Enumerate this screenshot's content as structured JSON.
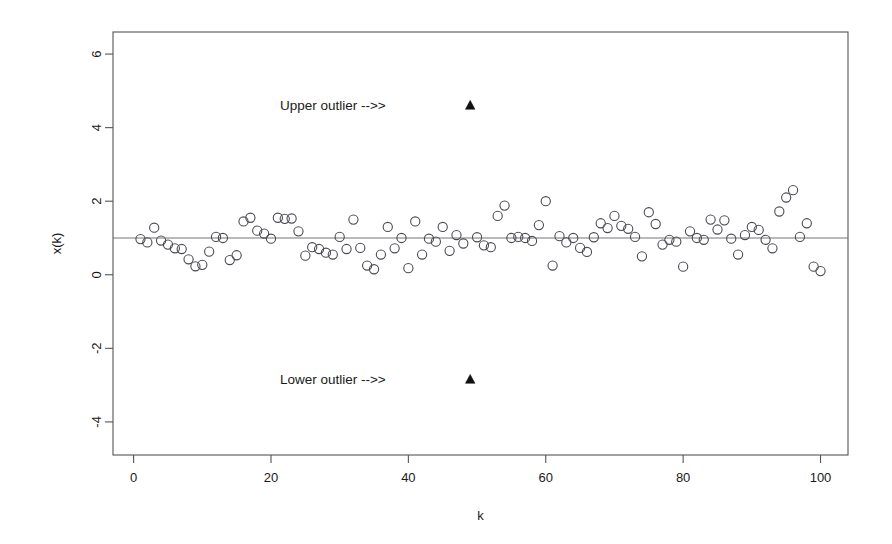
{
  "chart_data": {
    "type": "scatter",
    "title": "",
    "xlabel": "k",
    "ylabel": "x(k)",
    "xlim": [
      -3,
      104
    ],
    "ylim": [
      -4.9,
      6.6
    ],
    "grid": false,
    "legend": null,
    "xticks": [
      0,
      20,
      40,
      60,
      80,
      100
    ],
    "xtick_labels": [
      "0",
      "20",
      "40",
      "60",
      "80",
      "100"
    ],
    "yticks": [
      -4,
      -2,
      0,
      2,
      4,
      6
    ],
    "ytick_labels": [
      "-4",
      "-2",
      "0",
      "2",
      "4",
      "6"
    ],
    "reference_line": {
      "orientation": "horizontal",
      "y": 1,
      "label": ""
    },
    "marker_main": "open-circle",
    "marker_outlier": "filled-triangle",
    "annotations": [
      {
        "text": "Upper outlier -->>",
        "x": 29,
        "y": 4.6,
        "points_to_k": 49
      },
      {
        "text": "Lower outlier -->>",
        "x": 29,
        "y": -2.85,
        "points_to_k": 49
      }
    ],
    "series": [
      {
        "name": "x(k)",
        "marker": "open-circle",
        "x": [
          1,
          2,
          3,
          4,
          5,
          6,
          7,
          8,
          9,
          10,
          11,
          12,
          13,
          14,
          15,
          16,
          17,
          18,
          19,
          20,
          21,
          22,
          23,
          24,
          25,
          26,
          27,
          28,
          29,
          30,
          31,
          32,
          33,
          34,
          35,
          36,
          37,
          38,
          39,
          40,
          41,
          42,
          43,
          44,
          45,
          46,
          47,
          48,
          50,
          51,
          52,
          53,
          54,
          55,
          56,
          57,
          58,
          59,
          60,
          61,
          62,
          63,
          64,
          65,
          66,
          67,
          68,
          69,
          70,
          71,
          72,
          73,
          74,
          75,
          76,
          77,
          78,
          79,
          80,
          81,
          82,
          83,
          84,
          85,
          86,
          87,
          88,
          89,
          90,
          91,
          92,
          93,
          94,
          95,
          96,
          97,
          98,
          99,
          100
        ],
        "y": [
          0.97,
          0.88,
          1.28,
          0.93,
          0.82,
          0.72,
          0.7,
          0.42,
          0.23,
          0.27,
          0.63,
          1.03,
          1.0,
          0.4,
          0.53,
          1.45,
          1.55,
          1.2,
          1.12,
          0.98,
          1.55,
          1.52,
          1.53,
          1.18,
          0.52,
          0.75,
          0.7,
          0.6,
          0.55,
          1.03,
          0.7,
          1.5,
          0.73,
          0.25,
          0.15,
          0.55,
          1.3,
          0.72,
          1.0,
          0.18,
          1.45,
          0.55,
          0.98,
          0.9,
          1.3,
          0.65,
          1.08,
          0.85,
          1.02,
          0.8,
          0.75,
          1.6,
          1.88,
          1.0,
          1.03,
          1.0,
          0.92,
          1.35,
          2.0,
          0.25,
          1.05,
          0.88,
          1.0,
          0.73,
          0.62,
          1.02,
          1.4,
          1.27,
          1.6,
          1.33,
          1.25,
          1.03,
          0.5,
          1.7,
          1.38,
          0.82,
          0.95,
          0.9,
          0.22,
          1.18,
          1.0,
          0.95,
          1.5,
          1.23,
          1.48,
          0.98,
          0.55,
          1.08,
          1.3,
          1.22,
          0.95,
          0.72,
          1.72,
          2.1,
          2.3,
          1.03,
          1.4,
          0.22,
          0.1
        ]
      },
      {
        "name": "outliers",
        "marker": "filled-triangle",
        "x": [
          49,
          49
        ],
        "y": [
          4.6,
          -2.85
        ]
      }
    ]
  }
}
